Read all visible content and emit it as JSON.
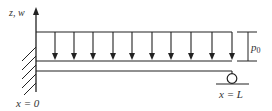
{
  "diagram": {
    "axis_label": "z, w",
    "load_label_base": "p",
    "load_label_sub": "0",
    "left_end_label": "x = 0",
    "right_end_label": "x = L",
    "load_arrow_count": 10,
    "colors": {
      "stroke": "#222222",
      "text": "#333333",
      "background": "#ffffff"
    },
    "supports": {
      "left": "fixed (clamped)",
      "right": "roller"
    }
  }
}
